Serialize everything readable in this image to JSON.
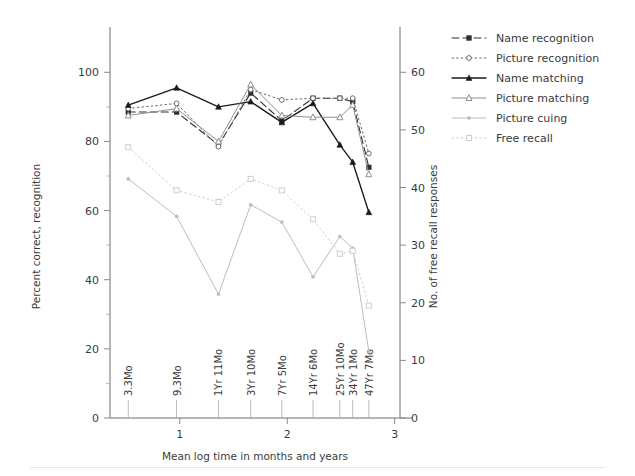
{
  "chart_data": {
    "type": "line",
    "title": "",
    "xlabel": "Mean log time in months and years",
    "ylabel_left": "Percent correct, recognition",
    "ylabel_right": "No. of free recall responses",
    "grid": false,
    "legend_position": "right",
    "xlim": [
      0.35,
      3.05
    ],
    "ylim_left": [
      0,
      105
    ],
    "ylim_right": [
      0,
      63
    ],
    "x_axis_ticks": [
      "1",
      "2",
      "3"
    ],
    "x_axis_tick_values": [
      1,
      2,
      3
    ],
    "y_axis_left_ticks": [
      "0",
      "20",
      "40",
      "60",
      "80",
      "100"
    ],
    "y_axis_left_tick_values": [
      0,
      20,
      40,
      60,
      80,
      100
    ],
    "y_axis_left_minor_tick_values": [
      10,
      30,
      50,
      70,
      90
    ],
    "y_axis_right_ticks": [
      "0",
      "10",
      "20",
      "30",
      "40",
      "50",
      "60"
    ],
    "y_axis_right_tick_values": [
      0,
      10,
      20,
      30,
      40,
      50,
      60
    ],
    "categories": [
      "3.3Mo",
      "9.3Mo",
      "1Yr 11Mo",
      "3Yr 10Mo",
      "7Yr 5Mo",
      "14Yr 6Mo",
      "25Yr 10Mo",
      "34Yr 1Mo",
      "47Yr 7Mo"
    ],
    "x": [
      0.52,
      0.97,
      1.36,
      1.66,
      1.95,
      2.24,
      2.49,
      2.61,
      2.76
    ],
    "series": [
      {
        "name": "Name recognition",
        "axis": "left",
        "style": "dashed",
        "marker": "filled-square",
        "color": "#303030",
        "values": [
          88.5,
          88.5,
          79.0,
          94.0,
          86.0,
          92.5,
          92.5,
          91.5,
          72.5
        ]
      },
      {
        "name": "Picture recognition",
        "axis": "left",
        "style": "dotted",
        "marker": "open-circle",
        "color": "#6b6b6b",
        "values": [
          89.5,
          91.0,
          78.5,
          95.0,
          92.0,
          92.5,
          92.5,
          92.5,
          76.5
        ]
      },
      {
        "name": "Name matching",
        "axis": "left",
        "style": "solid",
        "marker": "filled-triangle",
        "color": "#1a1a1a",
        "values": [
          90.5,
          95.5,
          90.0,
          91.5,
          85.5,
          91.0,
          79.0,
          74.0,
          59.5
        ]
      },
      {
        "name": "Picture matching",
        "axis": "left",
        "style": "solid-light",
        "marker": "open-triangle",
        "color": "#909090",
        "values": [
          87.5,
          89.5,
          80.0,
          96.5,
          87.5,
          87.0,
          87.0,
          90.5,
          70.5
        ]
      },
      {
        "name": "Picture cuing",
        "axis": "right",
        "style": "solid-light",
        "marker": "small-dot",
        "color": "#bdbdbd",
        "values": [
          41.5,
          35.0,
          21.5,
          37.0,
          34.0,
          24.5,
          31.5,
          29.5,
          11.5
        ]
      },
      {
        "name": "Free recall",
        "axis": "right",
        "style": "dotted",
        "marker": "open-square",
        "color": "#cfcfcf",
        "values": [
          47.0,
          39.5,
          37.5,
          41.5,
          39.5,
          34.5,
          28.5,
          29.0,
          19.5
        ]
      }
    ]
  },
  "legend": {
    "entries": [
      {
        "label": "Name recognition"
      },
      {
        "label": "Picture recognition"
      },
      {
        "label": "Name matching"
      },
      {
        "label": "Picture matching"
      },
      {
        "label": "Picture cuing"
      },
      {
        "label": "Free recall"
      }
    ]
  }
}
